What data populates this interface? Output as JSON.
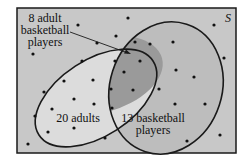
{
  "diagram": {
    "universe_label": "S",
    "labels": {
      "intersection_line1": "8 adult",
      "intersection_line2": "basketball",
      "intersection_line3": "players",
      "adults": "20 adults",
      "players_line1": "13 basketball",
      "players_line2": "players"
    },
    "sets": [
      {
        "name": "adults",
        "count": 20
      },
      {
        "name": "basketball players",
        "count": 13
      },
      {
        "name": "adult basketball players (intersection)",
        "count": 8
      }
    ],
    "colors": {
      "background": "#c8c8c8",
      "adults_fill": "#dcdcdc",
      "players_fill": "#bdbdbd",
      "intersection_fill": "#9a9a9a",
      "stroke": "#1a1a1a"
    }
  }
}
